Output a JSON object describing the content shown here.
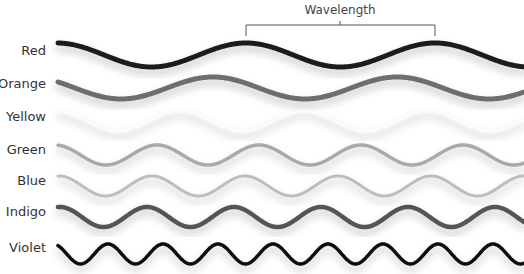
{
  "title": "Wavelength",
  "bracket": {
    "x1": 246,
    "x2": 435,
    "y": 25,
    "tick_bottom": 36,
    "label_x": 340
  },
  "waves": [
    {
      "name": "Red",
      "color": "#1f1f1f",
      "width": 5,
      "y": 55,
      "amp": 12,
      "period": 189,
      "peak_x": 246,
      "label_y": 45
    },
    {
      "name": "Orange",
      "color": "#6e6e6e",
      "width": 5,
      "y": 88,
      "amp": 11,
      "period": 184,
      "peak_x": 213,
      "label_y": 78
    },
    {
      "name": "Yellow",
      "color": "#fbfbfb",
      "width": 3,
      "y": 121,
      "amp": 10,
      "period": 124,
      "peak_x": 180,
      "label_y": 111
    },
    {
      "name": "Green",
      "color": "#a9a9a9",
      "width": 3.5,
      "y": 155,
      "amp": 10,
      "period": 102,
      "peak_x": 157,
      "label_y": 144
    },
    {
      "name": "Blue",
      "color": "#bdbdbd",
      "width": 3,
      "y": 186,
      "amp": 10,
      "period": 93,
      "peak_x": 152,
      "label_y": 175
    },
    {
      "name": "Indigo",
      "color": "#555555",
      "width": 4.5,
      "y": 217,
      "amp": 10,
      "period": 87,
      "peak_x": 147,
      "label_y": 206
    },
    {
      "name": "Violet",
      "color": "#111111",
      "width": 3.5,
      "y": 254,
      "amp": 10,
      "period": 55,
      "peak_x": 108,
      "label_y": 242
    }
  ],
  "x_start": 58,
  "x_end": 524
}
